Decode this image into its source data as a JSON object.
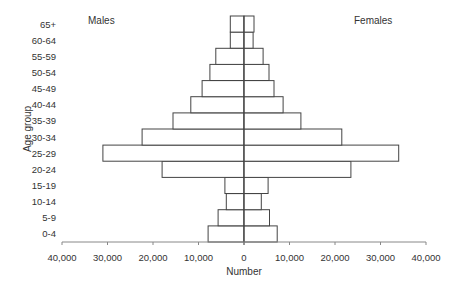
{
  "chart_data": {
    "type": "bar",
    "subtype": "population-pyramid",
    "orientation": "horizontal",
    "title": "",
    "xlabel": "Number",
    "ylabel": "Age group",
    "xlim": [
      -40000,
      40000
    ],
    "x_ticks": [
      -40000,
      -30000,
      -20000,
      -10000,
      0,
      10000,
      20000,
      30000,
      40000
    ],
    "x_tick_labels": [
      "40,000",
      "30,000",
      "20,000",
      "10,000",
      "0",
      "10,000",
      "20,000",
      "30,000",
      "40,000"
    ],
    "grid": false,
    "annotations": {
      "left": "Males",
      "right": "Females"
    },
    "categories": [
      "0-4",
      "5-9",
      "10-14",
      "15-19",
      "20-24",
      "25-29",
      "30-34",
      "35-39",
      "40-44",
      "45-49",
      "50-54",
      "55-59",
      "60-64",
      "65+"
    ],
    "series": [
      {
        "name": "Males",
        "side": "left",
        "values": [
          7900,
          5700,
          3900,
          4200,
          18000,
          31000,
          22400,
          15600,
          11700,
          9200,
          7500,
          6200,
          3000,
          3000
        ]
      },
      {
        "name": "Females",
        "side": "right",
        "values": [
          7300,
          5600,
          3800,
          5300,
          23500,
          34000,
          21500,
          12500,
          8600,
          6600,
          5500,
          4200,
          2000,
          2200
        ]
      }
    ],
    "colors": {
      "bar_fill": "#ffffff",
      "bar_stroke": "#444444",
      "axis": "#888888",
      "text": "#333333"
    }
  }
}
